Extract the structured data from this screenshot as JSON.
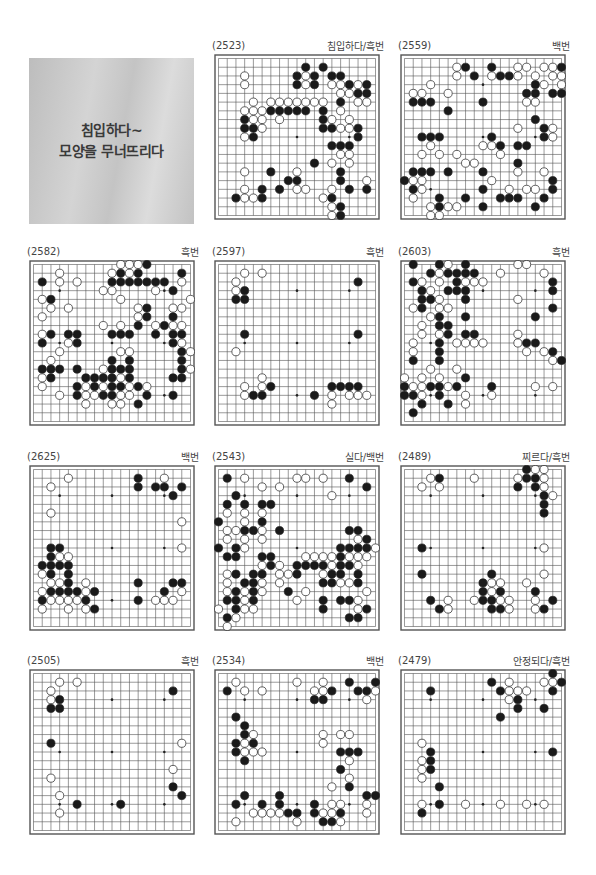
{
  "title": {
    "line1": "침입하다~",
    "line2": "모양을 무너뜨리다"
  },
  "colors": {
    "black": "#1a1a1a",
    "white": "#ffffff",
    "line": "#555555",
    "title_bg": "#c9c9c9"
  },
  "legend": {
    "X": "black-stone",
    "O": "white-stone",
    ".": "empty"
  },
  "problems": [
    {
      "number": "(2523)",
      "label": "침입하다/흑번",
      "rows": [
        "...................",
        "..........X.X......",
        "...O.....XOX.XX....",
        "...O.....XOX.OOXOX.",
        "..............OOXX.",
        "....O.OOOOOOO.X.OO.",
        "...OOOXXXXX.X.O....",
        "...XOO.O....XO.O...",
        "...XXO......XXOOX..",
        "...OX...........X..",
        ".............XXX...",
        "..............OO...",
        "...........X.O.O...",
        "...O..X..O....X....",
        "........XX....X..O.",
        "...O.X.X.OO..O.X.X.",
        "..XOOX......OX.....",
        ".............OX....",
        ".............OX...."
      ]
    },
    {
      "number": "(2559)",
      "label": "백번",
      "rows": [
        "...................",
        "......OX..X..OO.OOX",
        "......O.X.OXXO.O.OO",
        "...O...........XO.O",
        ".OO..O........XX.XX",
        ".XXX.....X....OO...",
        ".....X.............",
        "...............X...",
        ".............O..XO.",
        "..XXX.....X.....XO.",
        "...O.....OOX.XX....",
        "..O.O.O....O.......",
        ".......OO....X.....",
        ".XXX.X...X...O..O..",
        "XOO.......O......X.",
        ".XO......X..O.OO.X.",
        ".O..X..X...XXX..X..",
        "...OXOO..X.....X...",
        "...OO.............."
      ]
    },
    {
      "number": "(2582)",
      "label": "흑번",
      "rows": [
        "..........OOOX.....",
        "...O.....OXOX....X.",
        ".X.O.O...XXXXXXX.O.",
        "........OO....O.X..",
        ".OX.......O.......O",
        "..O.O.......OX..OO.",
        ".O..........OX..X..",
        "........O.O.X.OXOO.",
        ".OX.XX...XXX..X.XX.",
        ".X..OX..........XO.",
        "...O......OO.....XO",
        "..O......X.X.....X.",
        ".XXX.X..OXXX.....XO",
        ".OX...XXXXOX....XX.",
        ".O...XOXOXXOXO.....",
        "...O.XOOXXOO.X..X..",
        "......O..OO.X......",
        "...................",
        "..................."
      ]
    },
    {
      "number": "(2597)",
      "label": "흑번",
      "rows": [
        "...................",
        "...O.O.............",
        "..O.............X..",
        "..OX...............",
        "..XX...............",
        "...................",
        "...................",
        "...................",
        "...X............X..",
        "...................",
        "..O................",
        "...................",
        "...................",
        ".....O.............",
        "...O.OX......XXXX..",
        "...OXX.....X.O.OOO.",
        ".............O.....",
        "...................",
        "..................."
      ]
    },
    {
      "number": "(2603)",
      "label": "흑번",
      "rows": [
        ".X..XO.X.....OO....",
        "...XOXXXX..O....O..",
        ".XO.O.XOOO.......X.",
        "..XO.XXX.........X.",
        "..XXO..X.....O.....",
        ".OX.OO...........X.",
        "...OX..X.......X...",
        "..O.XX.............",
        "..O.OX.XX....O.....",
        ".O..X.OOOO...OXX...",
        ".O..X.........O.OX.",
        ".X..X............OX",
        "...O..O............",
        "O.O.O..X...........",
        "XOOXXOX...X....O.O.",
        "XXO.X..O..O........",
        "..X..X.O...........",
        ".X.................",
        "..................."
      ]
    },
    {
      "number": "(2625)",
      "label": "백번",
      "rows": [
        "...................",
        "....O.......X..O...",
        "..O.........X.XX.X.",
        "................X..",
        "...................",
        "..O................",
        ".................O.",
        "...................",
        "...................",
        "..XX.............O.",
        "..XOO..............",
        ".XXXX..............",
        ".OX.X..............",
        "..OOX.O.....X...XX.",
        ".OXXXXOX.......X.O.",
        ".XOOOOX.....X.OOO..",
        ".O..O.OX...........",
        "...................",
        "..................."
      ]
    },
    {
      "number": "(2543)",
      "label": "실다/백번",
      "rows": [
        "...................",
        ".X.O.....OO.O..X...",
        ".....O.O.........X.",
        "..X..........O.....",
        ".X.X.XX............",
        ".O.O.O.............",
        "X..O.X.............",
        ".OOXXO.X.......XX..",
        ".O.O.O..........OX.",
        "X.XO..........XXXXOX",
        ".XX..XX...OOOOXOOO.",
        ".....OXO.XXXXOXXO..",
        ".OX.XX.OOX..OXX.X..",
        ".O.XXO.O....XXOOX..",
        ".OXOXO..X.O......O.",
        ".XXOX....O..X.XXO..",
        "O.XOO.......X...OX.",
        ".XO............XX..",
        ".O................."
      ]
    },
    {
      "number": "(2489)",
      "label": "찌르다/흑번",
      "rows": [
        "..............XOO..",
        "...OX...O....OXXO..",
        "..O.O........X.XO..",
        "................XO.",
        "................X..",
        "................X..",
        "...................",
        "...................",
        "...................",
        "..X.............O..",
        "...................",
        "...................",
        "..X.......X.....O..",
        ".........XOO..O....",
        ".........XOX...X...",
        "...X.O..OXXOO..O.X.",
        "....XO....XXO..OX..",
        "...................",
        "..................."
      ]
    },
    {
      "number": "(2505)",
      "label": "흑번",
      "rows": [
        "...................",
        "...O.O.............",
        "..O.............X..",
        "..OX...............",
        "..XX...............",
        "...................",
        "...................",
        "...................",
        "..X..............O.",
        "...................",
        "...................",
        "................O..",
        "..O................",
        "................X..",
        "...O.............X.",
        ".....X....X........",
        "...O...............",
        "...................",
        "..................."
      ]
    },
    {
      "number": "(2534)",
      "label": "백번",
      "rows": [
        "...................",
        "..O......O..O..X..X",
        ".X.O.O.....OOX..XXO",
        "...........XX....O.",
        "...................",
        "..X................",
        "...X...............",
        "...XO.......O.OO...",
        "..XOX.......O......",
        "..XOOO........XXX..",
        "...X...........O...",
        "..............X....",
        "...............O...",
        ".............O.X...",
        "...X...X.........XX",
        "..X..X.X...X.OO..O.",
        "....OOOOXX.XOOX..O.",
        "..O......O..XXO....",
        "..................."
      ]
    },
    {
      "number": "(2479)",
      "label": "안정되다/흑번",
      "rows": [
        ".................X.",
        "..........X.O...OOX",
        "...X.......XOOO..X.",
        "............OX.....",
        ".............X..X..",
        "...........X.......",
        "...................",
        "...................",
        "..O................",
        "...X.............X.",
        "..OX...............",
        "..OX...............",
        "..O................",
        "....X..............",
        "...................",
        "..O.X..O...O..O.O..",
        "..X................",
        "...................",
        "..................."
      ]
    }
  ]
}
